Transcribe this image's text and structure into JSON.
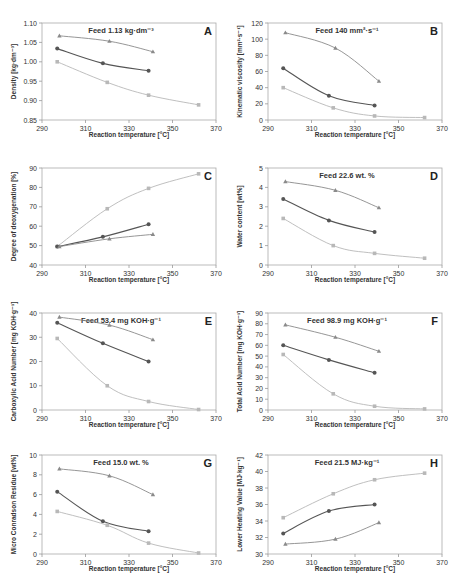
{
  "figure": {
    "colors": {
      "dark": "#555555",
      "mid": "#8a8a8a",
      "light": "#b8b8b8",
      "axis": "#999999",
      "text": "#333333",
      "frame": "#aaaaaa"
    }
  },
  "chart_data": [
    {
      "id": "A",
      "type": "line",
      "panel_label": "A",
      "title": "Feed 1.13 kg·dm⁻³",
      "xlabel": "Reaction temperature [°C]",
      "ylabel": "Density [kg·dm⁻³]",
      "xlim": [
        290,
        370
      ],
      "ylim": [
        0.85,
        1.1
      ],
      "xticks": [
        290,
        310,
        330,
        350,
        370
      ],
      "yticks": [
        0.85,
        0.9,
        0.95,
        1.0,
        1.05,
        1.1
      ],
      "ytick_labels": [
        "0.85",
        "0.90",
        "0.95",
        "1.00",
        "1.05",
        "1.10"
      ],
      "series": [
        {
          "name": "mid-triangle",
          "color": "mid",
          "marker": "triangle",
          "x": [
            298,
            321,
            341
          ],
          "y": [
            1.067,
            1.053,
            1.026
          ]
        },
        {
          "name": "dark-circle",
          "color": "dark",
          "marker": "circle",
          "x": [
            297,
            318,
            339
          ],
          "y": [
            1.034,
            0.996,
            0.977
          ]
        },
        {
          "name": "light-square",
          "color": "light",
          "marker": "square",
          "x": [
            297,
            320,
            339,
            362
          ],
          "y": [
            1.0,
            0.947,
            0.914,
            0.889
          ]
        }
      ]
    },
    {
      "id": "B",
      "type": "line",
      "panel_label": "B",
      "title": "Feed 140 mm²·s⁻¹",
      "xlabel": "Reaction temperature [°C]",
      "ylabel": "Kinematic viscosity [mm²·s⁻¹]",
      "xlim": [
        290,
        370
      ],
      "ylim": [
        0,
        120
      ],
      "xticks": [
        290,
        310,
        330,
        350,
        370
      ],
      "yticks": [
        0,
        20,
        40,
        60,
        80,
        100,
        120
      ],
      "ytick_labels": [
        "0",
        "20",
        "40",
        "60",
        "80",
        "100",
        "120"
      ],
      "series": [
        {
          "name": "mid-triangle",
          "color": "mid",
          "marker": "triangle",
          "x": [
            298,
            321,
            341
          ],
          "y": [
            108,
            89,
            48
          ]
        },
        {
          "name": "dark-circle",
          "color": "dark",
          "marker": "circle",
          "x": [
            297,
            318,
            339
          ],
          "y": [
            64,
            30,
            18
          ]
        },
        {
          "name": "light-square",
          "color": "light",
          "marker": "square",
          "x": [
            297,
            320,
            339,
            362
          ],
          "y": [
            40,
            15,
            5,
            3
          ]
        }
      ]
    },
    {
      "id": "C",
      "type": "line",
      "panel_label": "C",
      "title": "",
      "xlabel": "Reaction temperature [°C]",
      "ylabel": "Degree of deoxygenation [%]",
      "xlim": [
        290,
        370
      ],
      "ylim": [
        40,
        90
      ],
      "xticks": [
        290,
        310,
        330,
        350,
        370
      ],
      "yticks": [
        40,
        50,
        60,
        70,
        80,
        90
      ],
      "ytick_labels": [
        "40",
        "50",
        "60",
        "70",
        "80",
        "90"
      ],
      "series": [
        {
          "name": "light-square",
          "color": "light",
          "marker": "square",
          "x": [
            297,
            320,
            339,
            362
          ],
          "y": [
            49.5,
            69,
            79.5,
            87
          ]
        },
        {
          "name": "dark-circle",
          "color": "dark",
          "marker": "circle",
          "x": [
            297,
            318,
            339
          ],
          "y": [
            49.5,
            54.5,
            61
          ]
        },
        {
          "name": "mid-triangle",
          "color": "mid",
          "marker": "triangle",
          "x": [
            298,
            321,
            341
          ],
          "y": [
            49.5,
            53.5,
            55.8
          ]
        }
      ]
    },
    {
      "id": "D",
      "type": "line",
      "panel_label": "D",
      "title": "Feed 22.6 wt. %",
      "xlabel": "Reaction temperature [°C]",
      "ylabel": "Water content [wt%]",
      "xlim": [
        290,
        370
      ],
      "ylim": [
        0,
        5
      ],
      "xticks": [
        290,
        310,
        330,
        350,
        370
      ],
      "yticks": [
        0,
        1,
        2,
        3,
        4,
        5
      ],
      "ytick_labels": [
        "0",
        "1",
        "2",
        "3",
        "4",
        "5"
      ],
      "series": [
        {
          "name": "mid-triangle",
          "color": "mid",
          "marker": "triangle",
          "x": [
            298,
            321,
            341
          ],
          "y": [
            4.3,
            3.85,
            2.95
          ]
        },
        {
          "name": "dark-circle",
          "color": "dark",
          "marker": "circle",
          "x": [
            297,
            318,
            339
          ],
          "y": [
            3.4,
            2.3,
            1.7
          ]
        },
        {
          "name": "light-square",
          "color": "light",
          "marker": "square",
          "x": [
            297,
            320,
            339,
            362
          ],
          "y": [
            2.4,
            1.0,
            0.6,
            0.35
          ]
        }
      ]
    },
    {
      "id": "E",
      "type": "line",
      "panel_label": "E",
      "title": "Feed 53.4 mg KOH·g⁻¹",
      "xlabel": "Reaction temperature [°C]",
      "ylabel": "Carboxylic Acid Number [mg KOH·g⁻¹]",
      "xlim": [
        290,
        370
      ],
      "ylim": [
        0,
        40
      ],
      "xticks": [
        290,
        310,
        330,
        350,
        370
      ],
      "yticks": [
        0,
        10,
        20,
        30,
        40
      ],
      "ytick_labels": [
        "0",
        "10",
        "20",
        "30",
        "40"
      ],
      "series": [
        {
          "name": "mid-triangle",
          "color": "mid",
          "marker": "triangle",
          "x": [
            298,
            321,
            341
          ],
          "y": [
            38.3,
            35,
            29
          ]
        },
        {
          "name": "dark-circle",
          "color": "dark",
          "marker": "circle",
          "x": [
            297,
            318,
            339
          ],
          "y": [
            36,
            27.5,
            20
          ]
        },
        {
          "name": "light-square",
          "color": "light",
          "marker": "square",
          "x": [
            297,
            320,
            339,
            362
          ],
          "y": [
            29.5,
            10,
            3.5,
            0.2
          ]
        }
      ]
    },
    {
      "id": "F",
      "type": "line",
      "panel_label": "F",
      "title": "Feed 98.9 mg KOH·g⁻¹",
      "xlabel": "Reaction temperature [°C]",
      "ylabel": "Total Acid Number [mg KOH·g⁻¹]",
      "xlim": [
        290,
        370
      ],
      "ylim": [
        0,
        90
      ],
      "xticks": [
        290,
        310,
        330,
        350,
        370
      ],
      "yticks": [
        0,
        10,
        20,
        30,
        40,
        50,
        60,
        70,
        80,
        90
      ],
      "ytick_labels": [
        "0",
        "10",
        "20",
        "30",
        "40",
        "50",
        "60",
        "70",
        "80",
        "90"
      ],
      "series": [
        {
          "name": "mid-triangle",
          "color": "mid",
          "marker": "triangle",
          "x": [
            298,
            321,
            341
          ],
          "y": [
            79,
            67.5,
            54.5
          ]
        },
        {
          "name": "dark-circle",
          "color": "dark",
          "marker": "circle",
          "x": [
            297,
            318,
            339
          ],
          "y": [
            60,
            46.5,
            34.5
          ]
        },
        {
          "name": "light-square",
          "color": "light",
          "marker": "square",
          "x": [
            297,
            320,
            339,
            362
          ],
          "y": [
            51.5,
            15,
            3.5,
            1
          ]
        }
      ]
    },
    {
      "id": "G",
      "type": "line",
      "panel_label": "G",
      "title": "Feed 15.0 wt. %",
      "xlabel": "Reaction temperature [°C]",
      "ylabel": "Micro Conradson Residue [wt%]",
      "xlim": [
        290,
        370
      ],
      "ylim": [
        0,
        10
      ],
      "xticks": [
        290,
        310,
        330,
        350,
        370
      ],
      "yticks": [
        0,
        2,
        4,
        6,
        8,
        10
      ],
      "ytick_labels": [
        "0",
        "2",
        "4",
        "6",
        "8",
        "10"
      ],
      "series": [
        {
          "name": "mid-triangle",
          "color": "mid",
          "marker": "triangle",
          "x": [
            298,
            321,
            341
          ],
          "y": [
            8.6,
            7.9,
            6.0
          ]
        },
        {
          "name": "dark-circle",
          "color": "dark",
          "marker": "circle",
          "x": [
            297,
            318,
            339
          ],
          "y": [
            6.3,
            3.3,
            2.3
          ]
        },
        {
          "name": "light-square",
          "color": "light",
          "marker": "square",
          "x": [
            297,
            320,
            339,
            362
          ],
          "y": [
            4.3,
            2.9,
            1.1,
            0.1
          ]
        }
      ]
    },
    {
      "id": "H",
      "type": "line",
      "panel_label": "H",
      "title": "Feed 21.5 MJ·kg⁻¹",
      "xlabel": "Reaction temperature [°C]",
      "ylabel": "Lower Heating Value [MJ·kg⁻¹]",
      "xlim": [
        290,
        370
      ],
      "ylim": [
        30,
        42
      ],
      "xticks": [
        290,
        310,
        330,
        350,
        370
      ],
      "yticks": [
        30,
        32,
        34,
        36,
        38,
        40,
        42
      ],
      "ytick_labels": [
        "30",
        "32",
        "34",
        "36",
        "38",
        "40",
        "42"
      ],
      "series": [
        {
          "name": "light-square",
          "color": "light",
          "marker": "square",
          "x": [
            297,
            320,
            339,
            362
          ],
          "y": [
            34.4,
            37.3,
            39.0,
            39.8
          ]
        },
        {
          "name": "dark-circle",
          "color": "dark",
          "marker": "circle",
          "x": [
            297,
            318,
            339
          ],
          "y": [
            32.5,
            35.2,
            36.0
          ]
        },
        {
          "name": "mid-triangle",
          "color": "mid",
          "marker": "triangle",
          "x": [
            298,
            321,
            341
          ],
          "y": [
            31.2,
            31.8,
            33.8
          ]
        }
      ]
    }
  ],
  "layout": {
    "panels": [
      {
        "id": "A",
        "x": 0,
        "y": 0
      },
      {
        "id": "B",
        "x": 226,
        "y": 0
      },
      {
        "id": "C",
        "x": 0,
        "y": 145
      },
      {
        "id": "D",
        "x": 226,
        "y": 145
      },
      {
        "id": "E",
        "x": 0,
        "y": 290
      },
      {
        "id": "F",
        "x": 226,
        "y": 290
      },
      {
        "id": "G",
        "x": 0,
        "y": 432
      },
      {
        "id": "H",
        "x": 226,
        "y": 432
      }
    ]
  }
}
